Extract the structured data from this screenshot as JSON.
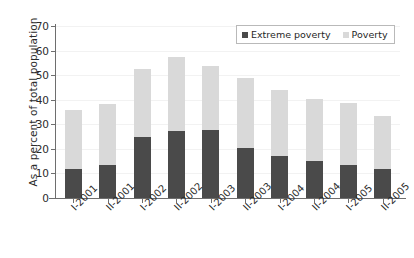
{
  "chart_data": {
    "type": "bar",
    "stacked": true,
    "title": "",
    "xlabel": "",
    "ylabel": "As a percent of total population",
    "ylim": [
      0,
      70
    ],
    "ytick_step": 10,
    "yticks": [
      70,
      60,
      50,
      40,
      30,
      20,
      10,
      0
    ],
    "grid": true,
    "legend_position": "top-right",
    "categories": [
      "I-2001",
      "II-2001",
      "I-2002",
      "II-2002",
      "I-2003",
      "II-2003",
      "I-2004",
      "II-2004",
      "I-2005",
      "II-2005"
    ],
    "series": [
      {
        "name": "Extreme poverty",
        "color": "#4a4a4a",
        "values": [
          11.8,
          13.5,
          24.8,
          27.3,
          27.5,
          20.5,
          17.0,
          15.0,
          13.6,
          12.0
        ]
      },
      {
        "name": "Poverty",
        "color": "#d9d9d9",
        "values": [
          24.0,
          24.7,
          27.7,
          30.1,
          26.2,
          28.3,
          27.0,
          25.3,
          25.0,
          21.2
        ]
      }
    ],
    "totals": [
      35.8,
      38.2,
      52.5,
      57.4,
      53.7,
      48.8,
      44.0,
      40.3,
      38.6,
      33.2
    ]
  },
  "legend": {
    "items": [
      {
        "label": "Extreme poverty",
        "color": "#4a4a4a"
      },
      {
        "label": "Poverty",
        "color": "#d9d9d9"
      }
    ]
  },
  "axis": {
    "y_title": "As a percent of total population"
  },
  "colors": {
    "extreme_poverty": "#4a4a4a",
    "poverty": "#d9d9d9",
    "axis": "#6e6e6e",
    "grid": "#f2f2f2",
    "background": "#ffffff"
  }
}
